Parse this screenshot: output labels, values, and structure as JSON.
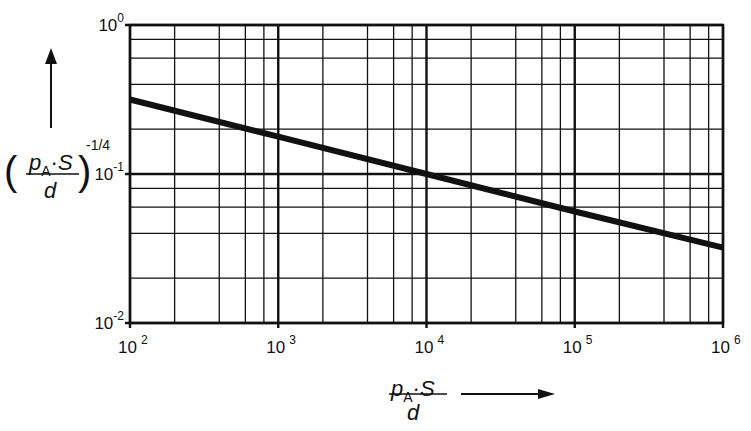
{
  "chart_data": {
    "type": "line",
    "title": "",
    "xscale": "log",
    "yscale": "log",
    "xlim": [
      100,
      1000000
    ],
    "ylim": [
      0.01,
      1
    ],
    "grid": true,
    "grid_minor_multipliers": [
      2,
      4,
      6,
      8
    ],
    "xlabel": "p_A · S / d",
    "ylabel": "(p_A · S / d)^(-1/4)",
    "x_ticks": [
      {
        "base": "10",
        "exp": "2",
        "value": 100
      },
      {
        "base": "10",
        "exp": "3",
        "value": 1000
      },
      {
        "base": "10",
        "exp": "4",
        "value": 10000
      },
      {
        "base": "10",
        "exp": "5",
        "value": 100000
      },
      {
        "base": "10",
        "exp": "6",
        "value": 1000000
      }
    ],
    "y_ticks": [
      {
        "base": "10",
        "exp": "0",
        "value": 1
      },
      {
        "base": "10",
        "exp": "-1",
        "value": 0.1
      },
      {
        "base": "10",
        "exp": "-2",
        "value": 0.01
      }
    ],
    "series": [
      {
        "name": "(p_A·S/d)^(-1/4)",
        "x": [
          100,
          1000,
          10000,
          100000,
          1000000
        ],
        "y": [
          0.316,
          0.178,
          0.1,
          0.056,
          0.032
        ]
      }
    ],
    "legend": null
  },
  "axis_labels": {
    "x": {
      "num_main": "p",
      "num_sub": "A",
      "num_rest": "·S",
      "den": "d"
    },
    "y": {
      "open": "(",
      "num_main": "p",
      "num_sub": "A",
      "num_rest": "·S",
      "den": "d",
      "close": ")",
      "exp": "-1/4"
    }
  }
}
